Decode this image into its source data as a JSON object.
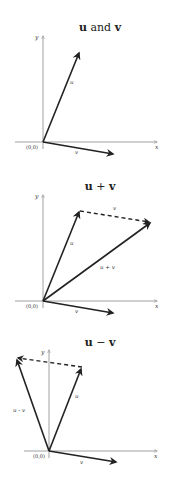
{
  "colors": {
    "background": "#ffffff",
    "vector": "#222222",
    "axis": "#888888"
  },
  "panels": [
    {
      "title_parts": [
        "u",
        " and ",
        "v"
      ],
      "title": "u and v",
      "origin_label": "(0,0)",
      "x_axis_label": "x",
      "y_axis_label": "y",
      "vectors": [
        {
          "name": "u",
          "label": "u",
          "style": "solid"
        },
        {
          "name": "v",
          "label": "v",
          "style": "solid"
        }
      ]
    },
    {
      "title_parts": [
        "u",
        " + ",
        "v"
      ],
      "title": "u + v",
      "origin_label": "(0,0)",
      "x_axis_label": "x",
      "y_axis_label": "y",
      "vectors": [
        {
          "name": "u",
          "label": "u",
          "style": "solid"
        },
        {
          "name": "v",
          "label": "v",
          "style": "solid"
        },
        {
          "name": "v-translated",
          "label": "v",
          "style": "dashed"
        },
        {
          "name": "u-plus-v",
          "label": "u + v",
          "style": "solid"
        }
      ]
    },
    {
      "title_parts": [
        "u",
        " − ",
        "v"
      ],
      "title": "u − v",
      "origin_label": "(0,0)",
      "x_axis_label": "x",
      "y_axis_label": "y",
      "vectors": [
        {
          "name": "u",
          "label": "u",
          "style": "solid"
        },
        {
          "name": "v",
          "label": "v",
          "style": "solid"
        },
        {
          "name": "negative-v-translated",
          "label": "",
          "style": "dashed"
        },
        {
          "name": "u-minus-v",
          "label": "u - v",
          "style": "solid"
        }
      ]
    }
  ]
}
